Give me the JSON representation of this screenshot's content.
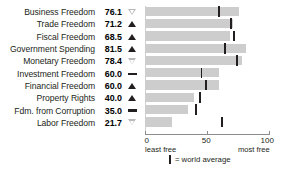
{
  "chart_data": {
    "type": "bar",
    "orientation": "horizontal",
    "title": "",
    "xlabel": "",
    "ylabel": "",
    "xlim": [
      0,
      100
    ],
    "ticks": [
      0,
      50,
      100
    ],
    "grid": false,
    "axis_end_labels": {
      "left": "least free",
      "right": "most free"
    },
    "legend": {
      "marker": "|",
      "label": "= world average",
      "position": "bottom-center"
    },
    "categories": [
      "Business Freedom",
      "Trade Freedom",
      "Fiscal Freedom",
      "Government Spending",
      "Monetary Freedom",
      "Investment Freedom",
      "Financial Freedom",
      "Property Rights",
      "Fdm. from Corruption",
      "Labor Freedom"
    ],
    "values": [
      76.1,
      71.2,
      68.5,
      81.5,
      78.4,
      60.0,
      60.0,
      40.0,
      35.0,
      21.7
    ],
    "value_labels": [
      "76.1",
      "71.2",
      "68.5",
      "81.5",
      "78.4",
      "60.0",
      "60.0",
      "40.0",
      "35.0",
      "21.7"
    ],
    "trend_markers": [
      "down",
      "up",
      "up",
      "up",
      "down",
      "flat",
      "up",
      "up",
      "flat",
      "down"
    ],
    "world_average": [
      59.5,
      69.0,
      71.0,
      64.0,
      74.0,
      45.0,
      48.5,
      44.0,
      40.5,
      61.5
    ],
    "colors": {
      "bar": "#cdcdcd",
      "average_tick": "#231f20",
      "text": "#231f20",
      "axis": "#8d8d8d",
      "marker_up": "#231f20",
      "marker_down": "#b9b9b9",
      "background": "#ffffff"
    }
  },
  "xtick_labels": [
    "0",
    "50",
    "100"
  ]
}
